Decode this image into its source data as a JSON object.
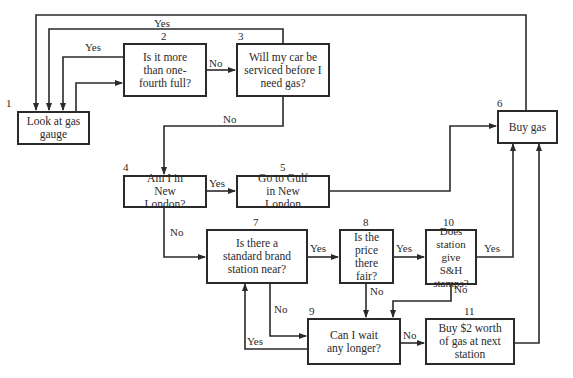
{
  "nodes": [
    {
      "id": "1",
      "number": "1",
      "text": "Look at gas gauge",
      "type": "action"
    },
    {
      "id": "2",
      "number": "2",
      "text": "Is it more than one-fourth full?",
      "type": "decision"
    },
    {
      "id": "3",
      "number": "3",
      "text": "Will my car be serviced before I need gas?",
      "type": "decision"
    },
    {
      "id": "4",
      "number": "4",
      "text": "Am I in New London?",
      "type": "decision"
    },
    {
      "id": "5",
      "number": "5",
      "text": "Go to Gulf in New London",
      "type": "action"
    },
    {
      "id": "6",
      "number": "6",
      "text": "Buy gas",
      "type": "action"
    },
    {
      "id": "7",
      "number": "7",
      "text": "Is there a standard brand station near?",
      "type": "decision"
    },
    {
      "id": "8",
      "number": "8",
      "text": "Is the price there fair?",
      "type": "decision"
    },
    {
      "id": "9",
      "number": "9",
      "text": "Can I wait any longer?",
      "type": "decision"
    },
    {
      "id": "10",
      "number": "10",
      "text": "Does station give S&H stamps?",
      "type": "decision"
    },
    {
      "id": "11",
      "number": "11",
      "text": "Buy $2 worth of gas at next station",
      "type": "action"
    }
  ],
  "edges": [
    {
      "from": "1",
      "to": "2",
      "label": ""
    },
    {
      "from": "2",
      "to": "1",
      "label": "Yes"
    },
    {
      "from": "2",
      "to": "3",
      "label": "No"
    },
    {
      "from": "3",
      "to": "1",
      "label": "Yes"
    },
    {
      "from": "3",
      "to": "4",
      "label": "No"
    },
    {
      "from": "4",
      "to": "5",
      "label": "Yes"
    },
    {
      "from": "4",
      "to": "7",
      "label": "No"
    },
    {
      "from": "5",
      "to": "6",
      "label": ""
    },
    {
      "from": "6",
      "to": "1",
      "label": ""
    },
    {
      "from": "7",
      "to": "8",
      "label": "Yes"
    },
    {
      "from": "7",
      "to": "9",
      "label": "No"
    },
    {
      "from": "8",
      "to": "10",
      "label": "Yes"
    },
    {
      "from": "8",
      "to": "9",
      "label": "No"
    },
    {
      "from": "10",
      "to": "6",
      "label": "Yes"
    },
    {
      "from": "10",
      "to": "9",
      "label": "No"
    },
    {
      "from": "9",
      "to": "7",
      "label": "Yes"
    },
    {
      "from": "9",
      "to": "11",
      "label": "No"
    },
    {
      "from": "11",
      "to": "6",
      "label": ""
    }
  ],
  "labels": {
    "yes": "Yes",
    "no": "No"
  }
}
